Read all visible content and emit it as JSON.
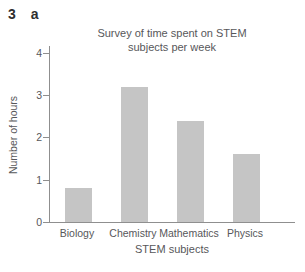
{
  "exercise": {
    "number": "3",
    "part": "a"
  },
  "chart_data": {
    "type": "bar",
    "title": "Survey of time spent on STEM subjects per week",
    "xlabel": "STEM subjects",
    "ylabel": "Number of hours",
    "categories": [
      "Biology",
      "Chemistry",
      "Mathematics",
      "Physics"
    ],
    "values": [
      0.8,
      3.2,
      2.4,
      1.6
    ],
    "ylim": [
      0,
      4
    ],
    "yticks": [
      0,
      1,
      2,
      3,
      4
    ],
    "grid": false,
    "legend": false,
    "colors": {
      "bar": "#c5c5c5",
      "axis": "#8f8f8f",
      "text": "#57575a",
      "exercise_text": "#2e2e2e",
      "background": "#ffffff"
    }
  }
}
